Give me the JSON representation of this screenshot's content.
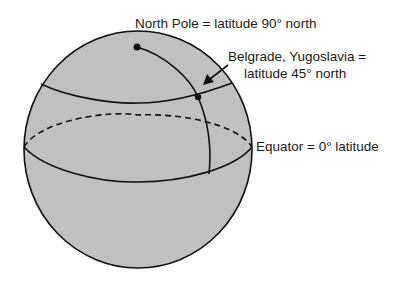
{
  "diagram": {
    "type": "sphere-latitude-illustration",
    "colors": {
      "background": "#ffffff",
      "sphere_fill": "#c0c0c0",
      "stroke": "#111111"
    },
    "labels": {
      "north_pole": "North Pole = latitude 90° north",
      "belgrade_line1": "Belgrade, Yugoslavia =",
      "belgrade_line2": "latitude 45° north",
      "equator": "Equator = 0° latitude"
    },
    "points": [
      {
        "name": "North Pole",
        "latitude": "90° north"
      },
      {
        "name": "Belgrade, Yugoslavia",
        "latitude": "45° north"
      }
    ],
    "lines": [
      {
        "name": "Equator",
        "latitude": "0°",
        "back_half_style": "dashed"
      },
      {
        "name": "45° north parallel"
      },
      {
        "name": "meridian",
        "from": "North Pole",
        "to": "Equator"
      }
    ]
  }
}
